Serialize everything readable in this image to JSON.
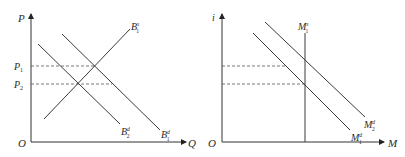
{
  "left_panel": {
    "y_axis_label": "P",
    "x_axis_label": "Q",
    "origin_label": "O",
    "price_levels": [
      {
        "base": "P",
        "sub": "1",
        "y": 66
      },
      {
        "base": "P",
        "sub": "2",
        "y": 84
      }
    ],
    "curves": [
      {
        "name": "B1s",
        "base": "B",
        "sup": "s",
        "sub": "1",
        "type": "supply",
        "from": [
          44,
          119
        ],
        "to": [
          130,
          29
        ],
        "label_pos": [
          131,
          28
        ]
      },
      {
        "name": "B1d",
        "base": "B",
        "sup": "d",
        "sub": "1",
        "type": "demand",
        "from": [
          62,
          34
        ],
        "to": [
          160,
          130
        ],
        "label_pos": [
          162,
          137
        ]
      },
      {
        "name": "B2d",
        "base": "B",
        "sup": "d",
        "sub": "2",
        "type": "demand",
        "from": [
          38,
          44
        ],
        "to": [
          120,
          124
        ],
        "label_pos": [
          121,
          134
        ]
      }
    ]
  },
  "right_panel": {
    "y_axis_label": "i",
    "x_axis_label": "M",
    "origin_label": "O",
    "curves": [
      {
        "name": "M1s",
        "base": "M",
        "sup": "s",
        "sub": "1",
        "type": "money-supply",
        "from": [
          305,
          32
        ],
        "to": [
          305,
          142
        ],
        "label_pos": [
          298,
          30
        ]
      },
      {
        "name": "M1d",
        "base": "M",
        "sup": "d",
        "sub": "1",
        "type": "money-demand",
        "from": [
          253,
          33
        ],
        "to": [
          350,
          130
        ],
        "label_pos": [
          351,
          140
        ]
      },
      {
        "name": "M2d",
        "base": "M",
        "sup": "d",
        "sub": "2",
        "type": "money-demand",
        "from": [
          265,
          22
        ],
        "to": [
          365,
          117
        ],
        "label_pos": [
          364,
          127
        ]
      }
    ],
    "dashed_levels": [
      {
        "y": 66,
        "to_x": 285
      },
      {
        "y": 84,
        "to_x": 305
      }
    ]
  }
}
